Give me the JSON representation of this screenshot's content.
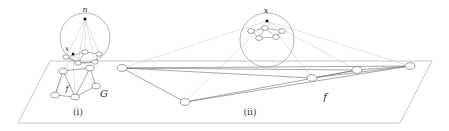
{
  "figure": {
    "caption_panels": [
      {
        "name": "panel-i-label",
        "text": "(i)",
        "x": 78,
        "y": 115,
        "size": 9
      },
      {
        "name": "panel-ii-label",
        "text": "(ii)",
        "x": 250,
        "y": 115,
        "size": 9
      }
    ],
    "labels": [
      {
        "name": "label-n-top-left-sphere",
        "text": "n",
        "x": 85,
        "y": 12,
        "size": 8,
        "style": "italic"
      },
      {
        "name": "label-x-left-sphere",
        "text": "x",
        "x": 67,
        "y": 51,
        "size": 7,
        "style": "italic"
      },
      {
        "name": "label-G-graph",
        "text": "G",
        "x": 104,
        "y": 97,
        "size": 10,
        "style": "italic"
      },
      {
        "name": "label-f-left-edge",
        "text": "f",
        "x": 67,
        "y": 91,
        "size": 8,
        "style": "italic"
      },
      {
        "name": "label-x-right-sphere",
        "text": "x",
        "x": 266,
        "y": 13,
        "size": 8,
        "style": "italic"
      },
      {
        "name": "label-f-right-edge",
        "text": "f",
        "x": 325,
        "y": 100,
        "size": 10,
        "style": "italic"
      }
    ],
    "plane": {
      "name": "ground-plane-parallelogram",
      "points": "50,61 432,61 400,123 18,123",
      "stroke": "#b9b9b9",
      "stroke_width": 0.8
    },
    "spheres": [
      {
        "name": "sphere-left",
        "cx": 85,
        "cy": 38,
        "r": 25,
        "stroke": "#9a9a9a"
      },
      {
        "name": "sphere-right",
        "cx": 267,
        "cy": 40,
        "r": 27,
        "stroke": "#9a9a9a"
      }
    ],
    "apex_points": [
      {
        "name": "apex-point-n",
        "cx": 85,
        "cy": 19,
        "size": 2.6,
        "fill": "#111111"
      },
      {
        "name": "apex-point-x-left",
        "cx": 73,
        "cy": 54,
        "size": 2.4,
        "fill": "#111111"
      },
      {
        "name": "apex-point-x-right",
        "cx": 267,
        "cy": 21,
        "size": 2.6,
        "fill": "#111111"
      }
    ],
    "graph_nodes_left": [
      {
        "name": "graph-node",
        "cx": 63,
        "cy": 71,
        "rx": 4.2,
        "ry": 2.8
      },
      {
        "name": "graph-node",
        "cx": 90,
        "cy": 68,
        "rx": 4.2,
        "ry": 2.8
      },
      {
        "name": "graph-node",
        "cx": 55,
        "cy": 95,
        "rx": 4.2,
        "ry": 2.8
      },
      {
        "name": "graph-node",
        "cx": 75,
        "cy": 97,
        "rx": 4.2,
        "ry": 2.8
      },
      {
        "name": "graph-node",
        "cx": 96,
        "cy": 86,
        "rx": 4.2,
        "ry": 2.8
      }
    ],
    "graph_edges_left": [
      {
        "name": "graph-edge",
        "x1": 63,
        "y1": 71,
        "x2": 90,
        "y2": 68
      },
      {
        "name": "graph-edge",
        "x1": 63,
        "y1": 71,
        "x2": 55,
        "y2": 95
      },
      {
        "name": "graph-edge",
        "x1": 63,
        "y1": 71,
        "x2": 75,
        "y2": 97
      },
      {
        "name": "graph-edge",
        "x1": 90,
        "y1": 68,
        "x2": 96,
        "y2": 86
      },
      {
        "name": "graph-edge",
        "x1": 90,
        "y1": 68,
        "x2": 75,
        "y2": 97
      },
      {
        "name": "graph-edge",
        "x1": 55,
        "y1": 95,
        "x2": 75,
        "y2": 97
      },
      {
        "name": "graph-edge",
        "x1": 75,
        "y1": 97,
        "x2": 96,
        "y2": 86
      }
    ],
    "sphere_graph_left": {
      "nodes": [
        {
          "name": "sphere-graph-node",
          "cx": 66,
          "cy": 57,
          "rx": 3.2,
          "ry": 2.2
        },
        {
          "name": "sphere-graph-node",
          "cx": 85,
          "cy": 52,
          "rx": 3.2,
          "ry": 2.2
        },
        {
          "name": "sphere-graph-node",
          "cx": 99,
          "cy": 54,
          "rx": 3.2,
          "ry": 2.2
        },
        {
          "name": "sphere-graph-node",
          "cx": 78,
          "cy": 63,
          "rx": 3.2,
          "ry": 2.2
        },
        {
          "name": "sphere-graph-node",
          "cx": 95,
          "cy": 62,
          "rx": 3.2,
          "ry": 2.2
        }
      ],
      "edges": [
        {
          "name": "sphere-graph-edge",
          "x1": 66,
          "y1": 57,
          "x2": 85,
          "y2": 52
        },
        {
          "name": "sphere-graph-edge",
          "x1": 85,
          "y1": 52,
          "x2": 99,
          "y2": 54
        },
        {
          "name": "sphere-graph-edge",
          "x1": 66,
          "y1": 57,
          "x2": 78,
          "y2": 63
        },
        {
          "name": "sphere-graph-edge",
          "x1": 78,
          "y1": 63,
          "x2": 95,
          "y2": 62
        },
        {
          "name": "sphere-graph-edge",
          "x1": 99,
          "y1": 54,
          "x2": 95,
          "y2": 62
        },
        {
          "name": "sphere-graph-edge",
          "x1": 85,
          "y1": 52,
          "x2": 78,
          "y2": 63
        }
      ]
    },
    "sphere_graph_right": {
      "nodes": [
        {
          "name": "sphere-graph-node",
          "cx": 251,
          "cy": 31,
          "rx": 3.4,
          "ry": 2.4
        },
        {
          "name": "sphere-graph-node",
          "cx": 265,
          "cy": 28,
          "rx": 3.4,
          "ry": 2.4
        },
        {
          "name": "sphere-graph-node",
          "cx": 282,
          "cy": 31,
          "rx": 3.4,
          "ry": 2.4
        },
        {
          "name": "sphere-graph-node",
          "cx": 259,
          "cy": 38,
          "rx": 3.4,
          "ry": 2.4
        },
        {
          "name": "sphere-graph-node",
          "cx": 276,
          "cy": 37,
          "rx": 3.4,
          "ry": 2.4
        }
      ],
      "edges": [
        {
          "name": "sphere-graph-edge",
          "x1": 251,
          "y1": 31,
          "x2": 265,
          "y2": 28
        },
        {
          "name": "sphere-graph-edge",
          "x1": 265,
          "y1": 28,
          "x2": 282,
          "y2": 31
        },
        {
          "name": "sphere-graph-edge",
          "x1": 251,
          "y1": 31,
          "x2": 259,
          "y2": 38
        },
        {
          "name": "sphere-graph-edge",
          "x1": 259,
          "y1": 38,
          "x2": 276,
          "y2": 37
        },
        {
          "name": "sphere-graph-edge",
          "x1": 282,
          "y1": 31,
          "x2": 276,
          "y2": 37
        },
        {
          "name": "sphere-graph-edge",
          "x1": 265,
          "y1": 28,
          "x2": 259,
          "y2": 38
        },
        {
          "name": "sphere-graph-edge",
          "x1": 265,
          "y1": 28,
          "x2": 276,
          "y2": 37
        }
      ]
    },
    "projection_rays_left": [
      {
        "name": "projection-ray",
        "x1": 85,
        "y1": 19,
        "x2": 66,
        "y2": 57
      },
      {
        "name": "projection-ray",
        "x1": 85,
        "y1": 19,
        "x2": 85,
        "y2": 52
      },
      {
        "name": "projection-ray",
        "x1": 85,
        "y1": 19,
        "x2": 99,
        "y2": 54
      },
      {
        "name": "projection-ray",
        "x1": 85,
        "y1": 19,
        "x2": 78,
        "y2": 63
      },
      {
        "name": "projection-ray",
        "x1": 85,
        "y1": 19,
        "x2": 95,
        "y2": 62
      },
      {
        "name": "projection-ray",
        "x1": 73,
        "y1": 54,
        "x2": 63,
        "y2": 71
      },
      {
        "name": "projection-ray",
        "x1": 73,
        "y1": 54,
        "x2": 90,
        "y2": 68
      },
      {
        "name": "projection-ray",
        "x1": 73,
        "y1": 54,
        "x2": 55,
        "y2": 95
      },
      {
        "name": "projection-ray",
        "x1": 73,
        "y1": 54,
        "x2": 75,
        "y2": 97
      },
      {
        "name": "projection-ray",
        "x1": 73,
        "y1": 54,
        "x2": 96,
        "y2": 86
      }
    ],
    "projection_rays_right": [
      {
        "name": "projection-ray",
        "x1": 267,
        "y1": 21,
        "x2": 122,
        "y2": 68
      },
      {
        "name": "projection-ray",
        "x1": 267,
        "y1": 21,
        "x2": 185,
        "y2": 102
      },
      {
        "name": "projection-ray",
        "x1": 267,
        "y1": 21,
        "x2": 312,
        "y2": 78
      },
      {
        "name": "projection-ray",
        "x1": 267,
        "y1": 21,
        "x2": 357,
        "y2": 70
      },
      {
        "name": "projection-ray",
        "x1": 267,
        "y1": 21,
        "x2": 410,
        "y2": 66
      }
    ],
    "graph_nodes_right": [
      {
        "name": "graph-node",
        "cx": 122,
        "cy": 68,
        "rx": 5.0,
        "ry": 3.4
      },
      {
        "name": "graph-node",
        "cx": 185,
        "cy": 102,
        "rx": 5.0,
        "ry": 3.4
      },
      {
        "name": "graph-node",
        "cx": 312,
        "cy": 78,
        "rx": 5.0,
        "ry": 3.4
      },
      {
        "name": "graph-node",
        "cx": 357,
        "cy": 70,
        "rx": 5.0,
        "ry": 3.4
      },
      {
        "name": "graph-node",
        "cx": 410,
        "cy": 66,
        "rx": 5.0,
        "ry": 3.4
      }
    ],
    "graph_edges_right": [
      {
        "name": "graph-edge",
        "x1": 122,
        "y1": 68,
        "x2": 185,
        "y2": 102
      },
      {
        "name": "graph-edge",
        "x1": 122,
        "y1": 68,
        "x2": 410,
        "y2": 66
      },
      {
        "name": "graph-edge",
        "x1": 122,
        "y1": 68,
        "x2": 357,
        "y2": 70
      },
      {
        "name": "graph-edge",
        "x1": 185,
        "y1": 102,
        "x2": 410,
        "y2": 66
      },
      {
        "name": "graph-edge",
        "x1": 185,
        "y1": 102,
        "x2": 357,
        "y2": 70
      },
      {
        "name": "graph-edge",
        "x1": 312,
        "y1": 78,
        "x2": 410,
        "y2": 66
      },
      {
        "name": "graph-edge",
        "x1": 357,
        "y1": 70,
        "x2": 410,
        "y2": 66
      },
      {
        "name": "graph-edge",
        "x1": 312,
        "y1": 78,
        "x2": 357,
        "y2": 70
      },
      {
        "name": "graph-edge",
        "x1": 122,
        "y1": 68,
        "x2": 312,
        "y2": 78
      }
    ],
    "colors": {
      "ink": "#6e6e6e",
      "ink_light": "#bfbfbf",
      "ink_dark": "#3a3a3a",
      "node_fill": "#ffffff",
      "background": "#ffffff"
    }
  }
}
